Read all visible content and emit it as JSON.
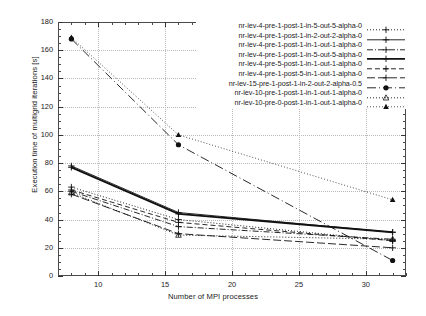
{
  "chart_data": {
    "type": "line",
    "title": "",
    "xlabel": "Number of MPI processes",
    "ylabel": "Execution time of multigrid iterations [s]",
    "xlim": [
      7,
      33
    ],
    "ylim": [
      0,
      180
    ],
    "xticks": [
      10,
      15,
      20,
      25,
      30
    ],
    "yticks": [
      0,
      20,
      40,
      60,
      80,
      100,
      120,
      140,
      160,
      180
    ],
    "grid": true,
    "legend_position": "top-right",
    "x": [
      8,
      16,
      32
    ],
    "series": [
      {
        "name": "nr-lev-4-pre-1-post-1-in-5-out-5-alpha-0",
        "values": [
          63,
          40,
          25
        ],
        "marker": "plus",
        "dash": "dotted"
      },
      {
        "name": "nr-lev-4-pre-1-post-1-in-2-out-2-alpha-0",
        "values": [
          78,
          45,
          31
        ],
        "marker": "plus",
        "dash": "solid-thin"
      },
      {
        "name": "nr-lev-4-pre-1-post-1-in-1-out-1-alpha-0",
        "values": [
          60,
          35,
          26
        ],
        "marker": "plus",
        "dash": "dash-dot"
      },
      {
        "name": "nr-lev-4-pre-1-post-1-in-5-out-5-alpha-0",
        "values": [
          77,
          44,
          31
        ],
        "marker": "plus",
        "dash": "solid-thick"
      },
      {
        "name": "nr-lev-4-pre-5-post-1-in-1-out-1-alpha-0",
        "values": [
          61,
          38,
          25
        ],
        "marker": "plus",
        "dash": "dashed"
      },
      {
        "name": "nr-lev-4-pre-1-post-5-in-1-out-1-alpha-0",
        "values": [
          58,
          30,
          20
        ],
        "marker": "plus",
        "dash": "dashed-long"
      },
      {
        "name": "nr-lev-15-pre-1-post-1-in-2-out-2-alpha-0.5",
        "values": [
          168,
          93,
          11
        ],
        "marker": "filled-circle",
        "dash": "dash-dot-long"
      },
      {
        "name": "nr-lev-10-pre-1-post-1-in-1-out-1-alpha-0",
        "values": [
          59,
          29,
          26
        ],
        "marker": "open-triangle",
        "dash": "dotted"
      },
      {
        "name": "nr-lev-10-pre-0-post-1-in-1-out-1-alpha-0",
        "values": [
          169,
          100,
          54
        ],
        "marker": "filled-triangle",
        "dash": "dotted-fine"
      }
    ]
  }
}
